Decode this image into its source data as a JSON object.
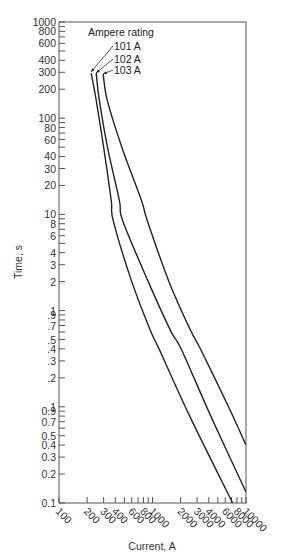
{
  "chart_data": {
    "type": "line",
    "title": "",
    "xlabel": "Current, A",
    "ylabel": "Time, s",
    "xscale": "log",
    "yscale": "log",
    "xlim": [
      100,
      10000
    ],
    "ylim": [
      0.01,
      1000
    ],
    "grid": false,
    "legend_title": "Ampere rating",
    "x_tick_labels": [
      "100",
      "200",
      "300",
      "400",
      "600",
      "800",
      "1000",
      "2000",
      "3000",
      "4000",
      "6000",
      "8000",
      "10000"
    ],
    "x_ticks": [
      {
        "value": 100,
        "label": "100"
      },
      {
        "value": 200,
        "label": "200"
      },
      {
        "value": 300,
        "label": "300"
      },
      {
        "value": 400,
        "label": "400"
      },
      {
        "value": 500,
        "label": ""
      },
      {
        "value": 600,
        "label": "600"
      },
      {
        "value": 700,
        "label": ""
      },
      {
        "value": 800,
        "label": "800"
      },
      {
        "value": 900,
        "label": ""
      },
      {
        "value": 1000,
        "label": "1000"
      },
      {
        "value": 2000,
        "label": "2000"
      },
      {
        "value": 3000,
        "label": "3000"
      },
      {
        "value": 4000,
        "label": "4000"
      },
      {
        "value": 5000,
        "label": ""
      },
      {
        "value": 6000,
        "label": "6000"
      },
      {
        "value": 7000,
        "label": ""
      },
      {
        "value": 8000,
        "label": "8000"
      },
      {
        "value": 9000,
        "label": ""
      },
      {
        "value": 10000,
        "label": "10000"
      }
    ],
    "y_ticks": [
      {
        "value": 1000,
        "label": "1000"
      },
      {
        "value": 900,
        "label": ""
      },
      {
        "value": 800,
        "label": "800"
      },
      {
        "value": 700,
        "label": ""
      },
      {
        "value": 600,
        "label": "600"
      },
      {
        "value": 500,
        "label": ""
      },
      {
        "value": 400,
        "label": "400"
      },
      {
        "value": 300,
        "label": "300"
      },
      {
        "value": 200,
        "label": "200"
      },
      {
        "value": 100,
        "label": "100"
      },
      {
        "value": 90,
        "label": ""
      },
      {
        "value": 80,
        "label": "80"
      },
      {
        "value": 70,
        "label": ""
      },
      {
        "value": 60,
        "label": "60"
      },
      {
        "value": 50,
        "label": ""
      },
      {
        "value": 40,
        "label": "40"
      },
      {
        "value": 30,
        "label": "30"
      },
      {
        "value": 20,
        "label": "20"
      },
      {
        "value": 10,
        "label": "10"
      },
      {
        "value": 9,
        "label": ""
      },
      {
        "value": 8,
        "label": "8"
      },
      {
        "value": 7,
        "label": ""
      },
      {
        "value": 6,
        "label": "6"
      },
      {
        "value": 5,
        "label": ""
      },
      {
        "value": 4,
        "label": "4"
      },
      {
        "value": 3,
        "label": "3"
      },
      {
        "value": 2,
        "label": "2"
      },
      {
        "value": 1,
        "label": "1"
      },
      {
        "value": 0.9,
        "label": ".9"
      },
      {
        "value": 0.8,
        "label": ""
      },
      {
        "value": 0.7,
        "label": ".7"
      },
      {
        "value": 0.6,
        "label": ""
      },
      {
        "value": 0.5,
        "label": ".5"
      },
      {
        "value": 0.4,
        "label": ".4"
      },
      {
        "value": 0.3,
        "label": ".3"
      },
      {
        "value": 0.2,
        "label": ".2"
      },
      {
        "value": 0.1,
        "label": ".1"
      },
      {
        "value": 0.09,
        "label": "0.9"
      },
      {
        "value": 0.08,
        "label": ""
      },
      {
        "value": 0.07,
        "label": "0.7"
      },
      {
        "value": 0.06,
        "label": ""
      },
      {
        "value": 0.05,
        "label": "0.5"
      },
      {
        "value": 0.04,
        "label": "0.4"
      },
      {
        "value": 0.03,
        "label": "0.3"
      },
      {
        "value": 0.02,
        "label": "0.2"
      },
      {
        "value": 0.01,
        "label": "0.1"
      }
    ],
    "series": [
      {
        "name": "101 A",
        "points": [
          [
            221,
            294
          ],
          [
            250,
            154
          ],
          [
            300,
            50
          ],
          [
            362,
            14
          ],
          [
            380,
            8.6
          ],
          [
            600,
            2
          ],
          [
            950,
            0.62
          ],
          [
            1190,
            0.39
          ],
          [
            2500,
            0.08
          ],
          [
            7200,
            0.01
          ]
        ]
      },
      {
        "name": "102 A",
        "points": [
          [
            250,
            294
          ],
          [
            270,
            154
          ],
          [
            330,
            50
          ],
          [
            442,
            14
          ],
          [
            480,
            8.6
          ],
          [
            900,
            2
          ],
          [
            1560,
            0.62
          ],
          [
            2050,
            0.39
          ],
          [
            4200,
            0.08
          ],
          [
            10000,
            0.013
          ]
        ]
      },
      {
        "name": "103 A",
        "points": [
          [
            297,
            287
          ],
          [
            328,
            154
          ],
          [
            470,
            50
          ],
          [
            761,
            14
          ],
          [
            880,
            8.6
          ],
          [
            1500,
            2
          ],
          [
            2560,
            0.62
          ],
          [
            3300,
            0.39
          ],
          [
            6500,
            0.1
          ],
          [
            10000,
            0.04
          ]
        ]
      }
    ]
  },
  "plot": {
    "x_title": "Current, A",
    "y_title": "Time, s",
    "annotation_title": "Ampere rating",
    "annotation_labels": [
      "101 A",
      "102 A",
      "103 A"
    ]
  },
  "colors": {
    "line": "#222222",
    "axis": "#555555",
    "text": "#333333"
  }
}
